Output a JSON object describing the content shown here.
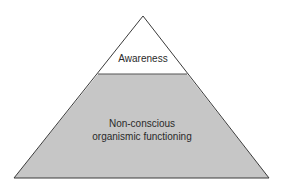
{
  "diagram": {
    "type": "pyramid",
    "levels": [
      {
        "label": "Awareness",
        "position": "top",
        "fill": "#ffffff"
      },
      {
        "label_lines": [
          "Non-conscious",
          "organismic functioning"
        ],
        "position": "bottom",
        "fill": "#c6c6c6"
      }
    ],
    "stroke": "#3a3a3a",
    "background": "#ffffff"
  }
}
